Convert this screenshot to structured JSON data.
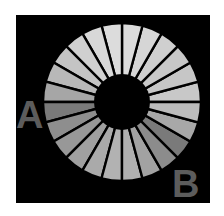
{
  "figure": {
    "type": "ring-illusion",
    "background": "#000000",
    "frame": {
      "x": 16,
      "y": 15,
      "width": 194,
      "height": 188
    },
    "ring": {
      "center": [
        122,
        102
      ],
      "outer_radius": 79,
      "inner_radius": 28,
      "segment_count": 24,
      "divider_color": "#000000",
      "divider_width": 2.4,
      "segment_colors": [
        "#c8c8c8",
        "#c6c6c6",
        "#c8c8c8",
        "#cfcfcf",
        "#d6d6d6",
        "#dcdcdc",
        "#dcdcdc",
        "#d8d8d8",
        "#d0d0d0",
        "#c4c4c4",
        "#b8b8b8",
        "#a6a6a6",
        "#7a7a7a",
        "#8e8e8e",
        "#989898",
        "#a0a0a0",
        "#aaaaaa",
        "#b2b2b2",
        "#b0b0b0",
        "#a2a2a2",
        "#8c8c8c",
        "#7a7a7a",
        "#a8a8a8",
        "#bcbcbc"
      ]
    },
    "labels": [
      {
        "text": "A",
        "x": 16,
        "y": 128,
        "size": 38,
        "color": "#5c5c5c"
      },
      {
        "text": "B",
        "x": 172,
        "y": 197,
        "size": 38,
        "color": "#5c5c5c"
      }
    ]
  }
}
